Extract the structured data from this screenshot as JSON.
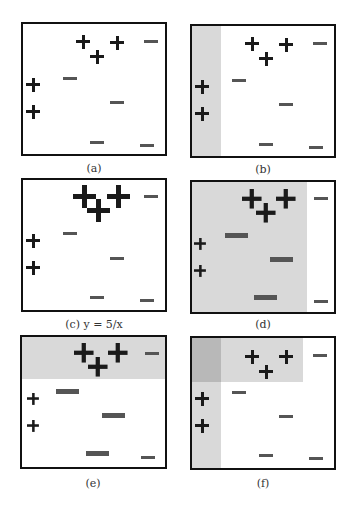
{
  "figure": {
    "captions": {
      "a": "(a)",
      "b": "(b)",
      "c": "(c) y = 5/x",
      "d": "(d)",
      "e": "(e)",
      "f": "(f)"
    },
    "points": {
      "positive": [
        [
          0.23,
          0.17
        ],
        [
          0.52,
          0.18
        ],
        [
          0.36,
          0.26
        ],
        [
          0.02,
          0.43
        ],
        [
          0.02,
          0.63
        ]
      ],
      "negative": [
        [
          0.85,
          0.12
        ],
        [
          0.28,
          0.4
        ],
        [
          0.62,
          0.58
        ],
        [
          0.48,
          0.88
        ],
        [
          0.83,
          0.9
        ]
      ]
    }
  }
}
